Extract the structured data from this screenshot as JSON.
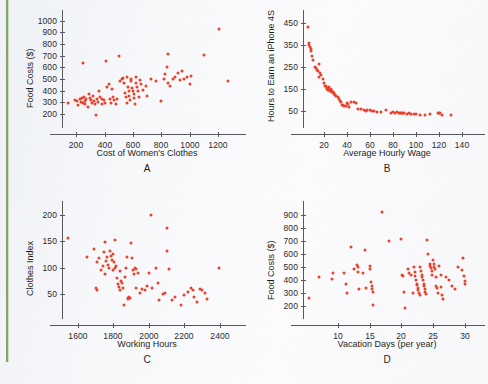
{
  "figure": {
    "marker_color": "#e8412c",
    "axis_color": "#58595b",
    "background_color": "#f7f8fa",
    "edge_rule_color": "#7fa05a"
  },
  "chart_data": [
    {
      "id": "A",
      "type": "scatter",
      "title": "",
      "panel_letter": "A",
      "xlabel": "Cost of Women's Clothes",
      "ylabel": "Food Costs ($)",
      "xticks": [
        200,
        400,
        600,
        800,
        1000,
        1200
      ],
      "yticks": [
        200,
        300,
        400,
        500,
        600,
        700,
        800,
        900,
        1000
      ],
      "xlim": [
        100,
        1300
      ],
      "ylim": [
        150,
        1040
      ],
      "grid": false,
      "legend": null,
      "points": [
        [
          140,
          300
        ],
        [
          190,
          320
        ],
        [
          205,
          310
        ],
        [
          215,
          275
        ],
        [
          225,
          330
        ],
        [
          235,
          305
        ],
        [
          240,
          340
        ],
        [
          245,
          635
        ],
        [
          250,
          300
        ],
        [
          255,
          350
        ],
        [
          260,
          315
        ],
        [
          265,
          290
        ],
        [
          270,
          330
        ],
        [
          280,
          265
        ],
        [
          290,
          370
        ],
        [
          300,
          340
        ],
        [
          305,
          320
        ],
        [
          310,
          300
        ],
        [
          320,
          355
        ],
        [
          325,
          310
        ],
        [
          330,
          290
        ],
        [
          340,
          195
        ],
        [
          350,
          330
        ],
        [
          355,
          305
        ],
        [
          360,
          400
        ],
        [
          370,
          345
        ],
        [
          380,
          290
        ],
        [
          385,
          330
        ],
        [
          395,
          325
        ],
        [
          400,
          300
        ],
        [
          410,
          655
        ],
        [
          420,
          435
        ],
        [
          430,
          460
        ],
        [
          440,
          330
        ],
        [
          445,
          300
        ],
        [
          455,
          415
        ],
        [
          460,
          345
        ],
        [
          470,
          320
        ],
        [
          480,
          290
        ],
        [
          490,
          330
        ],
        [
          500,
          695
        ],
        [
          510,
          480
        ],
        [
          520,
          500
        ],
        [
          530,
          510
        ],
        [
          540,
          465
        ],
        [
          545,
          380
        ],
        [
          550,
          345
        ],
        [
          555,
          300
        ],
        [
          560,
          520
        ],
        [
          565,
          430
        ],
        [
          570,
          395
        ],
        [
          575,
          355
        ],
        [
          580,
          320
        ],
        [
          585,
          500
        ],
        [
          590,
          480
        ],
        [
          595,
          420
        ],
        [
          600,
          400
        ],
        [
          605,
          370
        ],
        [
          610,
          340
        ],
        [
          615,
          285
        ],
        [
          620,
          520
        ],
        [
          625,
          470
        ],
        [
          630,
          430
        ],
        [
          635,
          395
        ],
        [
          640,
          345
        ],
        [
          650,
          490
        ],
        [
          660,
          460
        ],
        [
          670,
          410
        ],
        [
          690,
          440
        ],
        [
          700,
          355
        ],
        [
          730,
          500
        ],
        [
          760,
          480
        ],
        [
          800,
          315
        ],
        [
          820,
          505
        ],
        [
          830,
          545
        ],
        [
          840,
          600
        ],
        [
          845,
          715
        ],
        [
          850,
          470
        ],
        [
          860,
          440
        ],
        [
          880,
          500
        ],
        [
          900,
          515
        ],
        [
          920,
          550
        ],
        [
          930,
          490
        ],
        [
          950,
          570
        ],
        [
          960,
          500
        ],
        [
          980,
          520
        ],
        [
          1000,
          460
        ],
        [
          1010,
          525
        ],
        [
          1100,
          705
        ],
        [
          1210,
          930
        ],
        [
          1270,
          485
        ]
      ]
    },
    {
      "id": "B",
      "type": "scatter",
      "title": "",
      "panel_letter": "B",
      "xlabel": "Average Hourly Wage",
      "ylabel": "Hours to Earn an iPhone 4S",
      "xticks": [
        20,
        40,
        60,
        80,
        100,
        120,
        140
      ],
      "yticks": [
        50,
        150,
        250,
        350,
        450
      ],
      "xlim": [
        2,
        148
      ],
      "ylim": [
        10,
        480
      ],
      "grid": false,
      "legend": null,
      "points": [
        [
          6,
          432
        ],
        [
          7,
          360
        ],
        [
          7.5,
          348
        ],
        [
          8,
          340
        ],
        [
          8.5,
          330
        ],
        [
          9,
          320
        ],
        [
          10,
          300
        ],
        [
          11,
          280
        ],
        [
          12,
          250
        ],
        [
          13,
          245
        ],
        [
          14,
          238
        ],
        [
          15,
          230
        ],
        [
          15.5,
          205
        ],
        [
          16,
          262
        ],
        [
          17,
          222
        ],
        [
          18,
          215
        ],
        [
          19,
          195
        ],
        [
          20,
          178
        ],
        [
          21,
          166
        ],
        [
          22,
          162
        ],
        [
          22.5,
          155
        ],
        [
          23,
          150
        ],
        [
          23.5,
          152
        ],
        [
          24,
          148
        ],
        [
          24.5,
          160
        ],
        [
          25,
          145
        ],
        [
          25.5,
          143
        ],
        [
          26,
          150
        ],
        [
          26.5,
          140
        ],
        [
          27,
          138
        ],
        [
          27.5,
          142
        ],
        [
          28,
          136
        ],
        [
          28.5,
          130
        ],
        [
          29,
          128
        ],
        [
          30,
          125
        ],
        [
          31,
          118
        ],
        [
          32,
          112
        ],
        [
          33,
          105
        ],
        [
          34,
          98
        ],
        [
          35,
          92
        ],
        [
          36,
          80
        ],
        [
          37,
          76
        ],
        [
          38,
          74
        ],
        [
          39,
          72
        ],
        [
          40,
          88
        ],
        [
          41,
          82
        ],
        [
          42,
          70
        ],
        [
          44,
          92
        ],
        [
          46,
          90
        ],
        [
          48,
          85
        ],
        [
          50,
          62
        ],
        [
          52,
          58
        ],
        [
          55,
          55
        ],
        [
          57,
          52
        ],
        [
          58,
          56
        ],
        [
          60,
          54
        ],
        [
          62,
          50
        ],
        [
          64,
          52
        ],
        [
          66,
          48
        ],
        [
          70,
          46
        ],
        [
          74,
          55
        ],
        [
          78,
          44
        ],
        [
          80,
          46
        ],
        [
          82,
          43
        ],
        [
          84,
          45
        ],
        [
          85,
          42
        ],
        [
          86,
          44
        ],
        [
          87,
          41
        ],
        [
          88,
          43
        ],
        [
          89,
          40
        ],
        [
          90,
          42
        ],
        [
          92,
          38
        ],
        [
          94,
          40
        ],
        [
          96,
          38
        ],
        [
          98,
          36
        ],
        [
          100,
          38
        ],
        [
          104,
          35
        ],
        [
          108,
          34
        ],
        [
          112,
          36
        ],
        [
          119,
          42
        ],
        [
          120,
          44
        ],
        [
          121,
          40
        ],
        [
          123,
          32
        ],
        [
          131,
          34
        ]
      ]
    },
    {
      "id": "C",
      "type": "scatter",
      "title": "",
      "panel_letter": "C",
      "xlabel": "Working Hours",
      "ylabel": "Clothes Index",
      "xticks": [
        1600,
        1800,
        2000,
        2200,
        2400
      ],
      "yticks": [
        50,
        100,
        150,
        200
      ],
      "xlim": [
        1510,
        2470
      ],
      "ylim": [
        18,
        215
      ],
      "grid": false,
      "legend": null,
      "points": [
        [
          1545,
          157
        ],
        [
          1650,
          120
        ],
        [
          1690,
          135
        ],
        [
          1700,
          62
        ],
        [
          1705,
          110
        ],
        [
          1710,
          58
        ],
        [
          1720,
          118
        ],
        [
          1730,
          95
        ],
        [
          1740,
          103
        ],
        [
          1745,
          130
        ],
        [
          1750,
          88
        ],
        [
          1755,
          148
        ],
        [
          1760,
          112
        ],
        [
          1765,
          120
        ],
        [
          1770,
          105
        ],
        [
          1775,
          100
        ],
        [
          1780,
          132
        ],
        [
          1785,
          122
        ],
        [
          1790,
          115
        ],
        [
          1795,
          96
        ],
        [
          1800,
          126
        ],
        [
          1805,
          110
        ],
        [
          1808,
          152
        ],
        [
          1810,
          99
        ],
        [
          1815,
          104
        ],
        [
          1820,
          80
        ],
        [
          1825,
          70
        ],
        [
          1830,
          64
        ],
        [
          1835,
          94
        ],
        [
          1840,
          58
        ],
        [
          1845,
          75
        ],
        [
          1850,
          72
        ],
        [
          1855,
          62
        ],
        [
          1860,
          30
        ],
        [
          1865,
          83
        ],
        [
          1870,
          100
        ],
        [
          1875,
          120
        ],
        [
          1880,
          42
        ],
        [
          1885,
          40
        ],
        [
          1890,
          44
        ],
        [
          1895,
          42
        ],
        [
          1900,
          146
        ],
        [
          1905,
          118
        ],
        [
          1910,
          96
        ],
        [
          1915,
          88
        ],
        [
          1920,
          100
        ],
        [
          1925,
          97
        ],
        [
          1930,
          62
        ],
        [
          1940,
          90
        ],
        [
          1950,
          52
        ],
        [
          1960,
          60
        ],
        [
          1980,
          58
        ],
        [
          1990,
          66
        ],
        [
          2000,
          90
        ],
        [
          2015,
          199
        ],
        [
          2020,
          62
        ],
        [
          2040,
          100
        ],
        [
          2050,
          72
        ],
        [
          2060,
          38
        ],
        [
          2080,
          50
        ],
        [
          2090,
          52
        ],
        [
          2100,
          175
        ],
        [
          2105,
          131
        ],
        [
          2115,
          98
        ],
        [
          2130,
          38
        ],
        [
          2150,
          45
        ],
        [
          2180,
          30
        ],
        [
          2200,
          48
        ],
        [
          2220,
          54
        ],
        [
          2240,
          62
        ],
        [
          2250,
          58
        ],
        [
          2255,
          44
        ],
        [
          2270,
          36
        ],
        [
          2290,
          60
        ],
        [
          2300,
          58
        ],
        [
          2320,
          52
        ],
        [
          2330,
          40
        ],
        [
          2395,
          100
        ]
      ]
    },
    {
      "id": "D",
      "type": "scatter",
      "title": "",
      "panel_letter": "D",
      "xlabel": "Vacation Days (per year)",
      "ylabel": "Food Costs ($)",
      "xticks": [
        10,
        15,
        20,
        25,
        30
      ],
      "yticks": [
        200,
        300,
        400,
        500,
        600,
        700,
        800,
        900
      ],
      "xlim": [
        4.5,
        31
      ],
      "ylim": [
        160,
        960
      ],
      "grid": false,
      "legend": null,
      "points": [
        [
          5.5,
          262
        ],
        [
          7,
          425
        ],
        [
          9,
          410
        ],
        [
          9.2,
          455
        ],
        [
          11,
          450
        ],
        [
          11.2,
          370
        ],
        [
          11.4,
          295
        ],
        [
          12,
          655
        ],
        [
          12.5,
          485
        ],
        [
          13,
          515
        ],
        [
          13.1,
          495
        ],
        [
          13.2,
          460
        ],
        [
          13.3,
          330
        ],
        [
          14,
          450
        ],
        [
          14.2,
          630
        ],
        [
          14.5,
          335
        ],
        [
          15,
          510
        ],
        [
          15.1,
          480
        ],
        [
          15.2,
          380
        ],
        [
          15.3,
          355
        ],
        [
          15.4,
          330
        ],
        [
          15.5,
          310
        ],
        [
          15.6,
          210
        ],
        [
          17,
          925
        ],
        [
          18,
          695
        ],
        [
          20,
          715
        ],
        [
          20.1,
          440
        ],
        [
          20.3,
          430
        ],
        [
          20.5,
          310
        ],
        [
          20.6,
          185
        ],
        [
          21,
          480
        ],
        [
          21.2,
          455
        ],
        [
          21.5,
          435
        ],
        [
          21.8,
          300
        ],
        [
          22,
          495
        ],
        [
          22.1,
          460
        ],
        [
          22.2,
          430
        ],
        [
          22.3,
          400
        ],
        [
          22.4,
          370
        ],
        [
          22.5,
          360
        ],
        [
          22.6,
          340
        ],
        [
          22.7,
          320
        ],
        [
          22.8,
          300
        ],
        [
          22.9,
          285
        ],
        [
          23,
          495
        ],
        [
          23.1,
          470
        ],
        [
          23.2,
          440
        ],
        [
          23.3,
          420
        ],
        [
          23.4,
          395
        ],
        [
          23.5,
          370
        ],
        [
          23.6,
          350
        ],
        [
          23.7,
          330
        ],
        [
          23.8,
          305
        ],
        [
          23.9,
          290
        ],
        [
          24,
          705
        ],
        [
          24.2,
          600
        ],
        [
          24.5,
          520
        ],
        [
          24.6,
          505
        ],
        [
          24.7,
          490
        ],
        [
          24.8,
          465
        ],
        [
          24.9,
          440
        ],
        [
          25,
          555
        ],
        [
          25.1,
          520
        ],
        [
          25.2,
          500
        ],
        [
          25.3,
          480
        ],
        [
          25.4,
          420
        ],
        [
          25.5,
          355
        ],
        [
          25.6,
          335
        ],
        [
          25.8,
          300
        ],
        [
          26,
          505
        ],
        [
          26.2,
          440
        ],
        [
          26.3,
          345
        ],
        [
          26.4,
          280
        ],
        [
          26.5,
          250
        ],
        [
          27,
          420
        ],
        [
          27.5,
          400
        ],
        [
          28,
          350
        ],
        [
          28.5,
          330
        ],
        [
          29,
          500
        ],
        [
          29.5,
          475
        ],
        [
          29.8,
          570
        ],
        [
          29.9,
          430
        ],
        [
          30,
          390
        ],
        [
          30.1,
          365
        ]
      ]
    }
  ]
}
